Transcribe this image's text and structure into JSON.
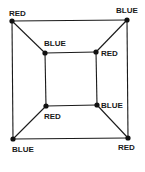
{
  "graph": {
    "nodes": [
      {
        "id": "outer-tl",
        "x": 12,
        "y": 21,
        "label": "RED",
        "lx": 9,
        "ly": 16
      },
      {
        "id": "outer-tr",
        "x": 127,
        "y": 20,
        "label": "BLUE",
        "lx": 116,
        "ly": 13
      },
      {
        "id": "outer-bl",
        "x": 13,
        "y": 139,
        "label": "BLUE",
        "lx": 12,
        "ly": 152
      },
      {
        "id": "outer-br",
        "x": 128,
        "y": 138,
        "label": "RED",
        "lx": 118,
        "ly": 150
      },
      {
        "id": "inner-tl",
        "x": 45,
        "y": 53,
        "label": "BLUE",
        "lx": 44,
        "ly": 46
      },
      {
        "id": "inner-tr",
        "x": 96,
        "y": 52,
        "label": "RED",
        "lx": 101,
        "ly": 56
      },
      {
        "id": "inner-bl",
        "x": 46,
        "y": 106,
        "label": "RED",
        "lx": 44,
        "ly": 119
      },
      {
        "id": "inner-br",
        "x": 97,
        "y": 105,
        "label": "BLUE",
        "lx": 101,
        "ly": 108
      }
    ],
    "edges": [
      [
        "outer-tl",
        "outer-tr"
      ],
      [
        "outer-tr",
        "outer-br"
      ],
      [
        "outer-br",
        "outer-bl"
      ],
      [
        "outer-bl",
        "outer-tl"
      ],
      [
        "inner-tl",
        "inner-tr"
      ],
      [
        "inner-tr",
        "inner-br"
      ],
      [
        "inner-br",
        "inner-bl"
      ],
      [
        "inner-bl",
        "inner-tl"
      ],
      [
        "outer-tl",
        "inner-tl"
      ],
      [
        "outer-tr",
        "inner-tr"
      ],
      [
        "outer-bl",
        "inner-bl"
      ],
      [
        "outer-br",
        "inner-br"
      ]
    ]
  }
}
